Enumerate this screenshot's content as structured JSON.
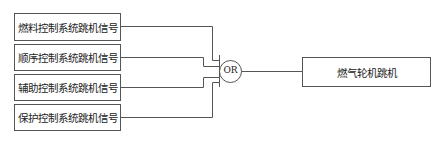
{
  "diagram": {
    "inputs": [
      {
        "label": "燃料控制系统跳机信号"
      },
      {
        "label": "顺序控制系统跳机信号"
      },
      {
        "label": "辅助控制系统跳机信号"
      },
      {
        "label": "保护控制系统跳机信号"
      }
    ],
    "gate": {
      "label": "OR"
    },
    "output": {
      "label": "燃气轮机跳机"
    },
    "colors": {
      "line": "#555555",
      "text": "#222222",
      "background": "#ffffff"
    }
  }
}
